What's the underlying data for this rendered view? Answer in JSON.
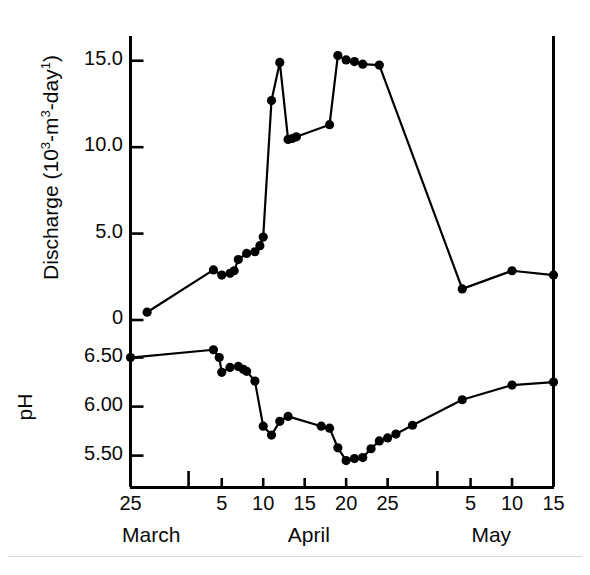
{
  "figure": {
    "background_color": "#ffffff",
    "ink_color": "#000000"
  },
  "axes": {
    "discharge": {
      "title": "Discharge (10",
      "title_sup1": "3",
      "title_mid": "-m",
      "title_sup2": "3",
      "title_end": "-day",
      "title_sup3": "1",
      "title_plain": "Discharge (10^3-m^3-day^1)",
      "tick_labels": [
        "15.0",
        "10.0",
        "5.0",
        "0"
      ],
      "tick_values": [
        15.0,
        10.0,
        5.0,
        0.0
      ],
      "ylim": [
        0,
        16.2
      ]
    },
    "ph": {
      "title": "pH",
      "tick_labels": [
        "6.50",
        "6.00",
        "5.50"
      ],
      "tick_values": [
        6.5,
        6.0,
        5.5
      ],
      "ylim": [
        5.18,
        6.72
      ]
    },
    "x": {
      "tick_labels": [
        "25",
        "",
        "5",
        "10",
        "15",
        "20",
        "25",
        "",
        "5",
        "10",
        "15"
      ],
      "tick_days": [
        0,
        7,
        11,
        16,
        21,
        26,
        31,
        37,
        41,
        46,
        51
      ],
      "major_tick_days": [
        0,
        7,
        37,
        51
      ],
      "month_labels": [
        "March",
        "April",
        "May"
      ],
      "month_positions_day": [
        2.5,
        21.5,
        43.5
      ],
      "range_days": [
        0,
        51
      ],
      "start_label": "March 25",
      "end_label": "May 15"
    }
  },
  "chart_data": {
    "type": "line",
    "title": "",
    "xlabel": "",
    "ylabel": "Discharge (10^3-m^3-day^1) / pH",
    "grid": false,
    "legend": "none",
    "marker": "filled-circle",
    "x_axis_unit": "days since March 25",
    "series": [
      {
        "name": "Discharge",
        "unit": "10^3 m^3 day^-1",
        "ylim": [
          0,
          16.2
        ],
        "x_days": [
          2,
          10,
          11,
          12,
          13,
          14,
          15,
          16,
          16.8,
          15.6,
          16,
          16.5,
          17,
          17.5,
          18,
          19,
          19.5,
          20,
          21,
          22,
          23,
          24,
          25,
          26,
          27,
          28,
          29,
          30,
          31,
          41,
          46,
          51
        ],
        "points": [
          {
            "date": "March 27",
            "day": 2,
            "value": 0.45
          },
          {
            "date": "April 4",
            "day": 10,
            "value": 2.9
          },
          {
            "date": "April 5",
            "day": 11,
            "value": 2.6
          },
          {
            "date": "April 6",
            "day": 12,
            "value": 2.7
          },
          {
            "date": "April 6.5",
            "day": 12.5,
            "value": 2.85
          },
          {
            "date": "April 7",
            "day": 13,
            "value": 3.5
          },
          {
            "date": "April 8",
            "day": 14,
            "value": 3.85
          },
          {
            "date": "April 9",
            "day": 15,
            "value": 3.95
          },
          {
            "date": "April 9.6",
            "day": 15.6,
            "value": 4.3
          },
          {
            "date": "April 10",
            "day": 16,
            "value": 4.8
          },
          {
            "date": "April 11",
            "day": 17,
            "value": 12.7
          },
          {
            "date": "April 12",
            "day": 18,
            "value": 14.9
          },
          {
            "date": "April 13",
            "day": 19,
            "value": 10.45
          },
          {
            "date": "April 13.5",
            "day": 19.5,
            "value": 10.5
          },
          {
            "date": "April 14",
            "day": 20,
            "value": 10.6
          },
          {
            "date": "April 18",
            "day": 24,
            "value": 11.3
          },
          {
            "date": "April 19",
            "day": 25,
            "value": 15.3
          },
          {
            "date": "April 20",
            "day": 26,
            "value": 15.05
          },
          {
            "date": "April 21",
            "day": 27,
            "value": 14.95
          },
          {
            "date": "April 22",
            "day": 28,
            "value": 14.8
          },
          {
            "date": "April 24",
            "day": 30,
            "value": 14.75
          },
          {
            "date": "May 4",
            "day": 40,
            "value": 1.8
          },
          {
            "date": "May 10",
            "day": 46,
            "value": 2.85
          },
          {
            "date": "May 15",
            "day": 51,
            "value": 2.6
          }
        ]
      },
      {
        "name": "pH",
        "unit": "pH units",
        "ylim": [
          5.18,
          6.72
        ],
        "points": [
          {
            "date": "March 25",
            "day": 0,
            "value": 6.5
          },
          {
            "date": "April 4",
            "day": 10,
            "value": 6.58
          },
          {
            "date": "April 4.7",
            "day": 10.7,
            "value": 6.5
          },
          {
            "date": "April 5",
            "day": 11,
            "value": 6.35
          },
          {
            "date": "April 6",
            "day": 12,
            "value": 6.4
          },
          {
            "date": "April 7",
            "day": 13,
            "value": 6.41
          },
          {
            "date": "April 7.6",
            "day": 13.6,
            "value": 6.38
          },
          {
            "date": "April 8",
            "day": 14,
            "value": 6.36
          },
          {
            "date": "April 9",
            "day": 15,
            "value": 6.26
          },
          {
            "date": "April 10",
            "day": 16,
            "value": 5.8
          },
          {
            "date": "April 11",
            "day": 17,
            "value": 5.71
          },
          {
            "date": "April 12",
            "day": 18,
            "value": 5.85
          },
          {
            "date": "April 13",
            "day": 19,
            "value": 5.9
          },
          {
            "date": "April 17",
            "day": 23,
            "value": 5.8
          },
          {
            "date": "April 18",
            "day": 24,
            "value": 5.78
          },
          {
            "date": "April 19",
            "day": 25,
            "value": 5.58
          },
          {
            "date": "April 20",
            "day": 26,
            "value": 5.45
          },
          {
            "date": "April 21",
            "day": 27,
            "value": 5.47
          },
          {
            "date": "April 22",
            "day": 28,
            "value": 5.48
          },
          {
            "date": "April 23",
            "day": 29,
            "value": 5.57
          },
          {
            "date": "April 24",
            "day": 30,
            "value": 5.65
          },
          {
            "date": "April 25",
            "day": 31,
            "value": 5.68
          },
          {
            "date": "April 26",
            "day": 32,
            "value": 5.72
          },
          {
            "date": "April 28",
            "day": 34,
            "value": 5.81
          },
          {
            "date": "May 4",
            "day": 40,
            "value": 6.07
          },
          {
            "date": "May 10",
            "day": 46,
            "value": 6.22
          },
          {
            "date": "May 15",
            "day": 51,
            "value": 6.25
          }
        ]
      }
    ]
  }
}
